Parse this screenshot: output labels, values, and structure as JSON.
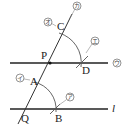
{
  "diagram": {
    "points": {
      "P": "P",
      "Q": "Q",
      "A": "A",
      "B": "B",
      "C": "C",
      "D": "D"
    },
    "line_label": "l",
    "step_labels": {
      "a": "ア",
      "i": "イ",
      "u": "ウ",
      "e": "エ",
      "o": "オ",
      "ka": "カ"
    },
    "colors": {
      "line": "#222222",
      "arc": "#444444",
      "circle": "#666666"
    }
  }
}
